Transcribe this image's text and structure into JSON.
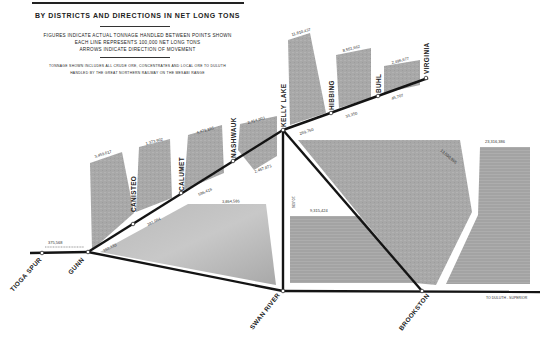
{
  "header": {
    "title": "BY DISTRICTS AND DIRECTIONS IN NET LONG TONS",
    "subtitle_lines": [
      "FIGURES INDICATE ACTUAL TONNAGE HANDLED BETWEEN POINTS SHOWN",
      "EACH LINE REPRESENTS 100,000 NET LONG TONS",
      "ARROWS INDICATE DIRECTION OF MOVEMENT"
    ],
    "note_lines": [
      "TONNAGE SHOWN INCLUDES ALL CRUDE ORE, CONCENTRATES AND LOCAL ORE TO DULUTH",
      "HANDLED BY THE GREAT NORTHERN RAILWAY ON THE MESABI RANGE"
    ]
  },
  "stations": {
    "tioga_spur": "TIOGA SPUR",
    "gunn": "GUNN",
    "canisteo": "CANISTEO",
    "calumet": "CALUMET",
    "nashwauk": "NASHWAUK",
    "kelly_lake": "KELLY LAKE",
    "hibbing": "HIBBING",
    "buhl": "BUHL",
    "virginia": "VIRGINIA",
    "swan_river": "SWAN RIVER",
    "brookston": "BROOKSTON"
  },
  "flows": {
    "tioga_gunn": "375,568",
    "canisteo_origin": "3,459,617",
    "calumet_origin": "1,373,902",
    "nashwauk_origin": "4,471,165",
    "kelly_origin": "2,414,903",
    "kelly_lake_origin": "11,810,437",
    "hibbing_origin": "8,551,662",
    "buhl_origin": "2,496,677",
    "gunn_canisteo": "151,133",
    "canisteo_calumet": "381,064",
    "calumet_nashwauk": "596,416",
    "nashwauk_kelly": "2,467,873",
    "kelly_hibbing": "269,760",
    "hibbing_buhl": "33,350",
    "buhl_virginia": "45,707",
    "gunn_swan": "3,864,586",
    "kelly_swan": "10,436",
    "swan_brookston": "9,315,424",
    "kelly_brookston": "13,500,965",
    "brookston_duluth": "23,316,386"
  },
  "destination": {
    "label": "TO DULUTH - SUPERIOR"
  },
  "colors": {
    "band": "#a9a9a9",
    "band_dark": "#9a9a9a",
    "track": "#141414",
    "background": "#ffffff"
  }
}
